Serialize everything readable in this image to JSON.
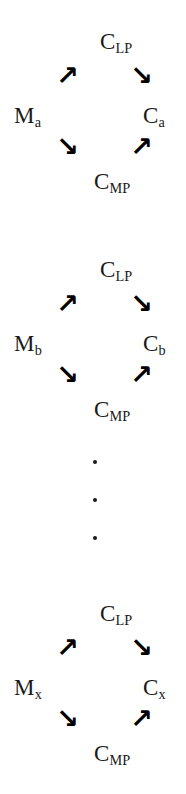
{
  "figure": {
    "type": "diagram",
    "kind": "reaction-cycle-series",
    "background_color": "#ffffff",
    "ink_color": "#1a1a1a",
    "width": 186,
    "height": 794
  },
  "blocks": [
    {
      "id": "block-a",
      "index": 1,
      "left_label": {
        "base": "M",
        "sub": "a"
      },
      "right_label": {
        "base": "C",
        "sub": "a"
      },
      "top_label": {
        "base": "C",
        "sub": "LP"
      },
      "bottom_label": {
        "base": "C",
        "sub": "MP"
      },
      "arrows": {
        "upper_left": "↗",
        "upper_right": "↘",
        "lower_left": "↘",
        "lower_right": "↗"
      }
    },
    {
      "id": "block-b",
      "index": 2,
      "left_label": {
        "base": "M",
        "sub": "b"
      },
      "right_label": {
        "base": "C",
        "sub": "b"
      },
      "top_label": {
        "base": "C",
        "sub": "LP"
      },
      "bottom_label": {
        "base": "C",
        "sub": "MP"
      },
      "arrows": {
        "upper_left": "↗",
        "upper_right": "↘",
        "lower_left": "↘",
        "lower_right": "↗"
      }
    },
    {
      "id": "block-x",
      "index": 3,
      "left_label": {
        "base": "M",
        "sub": "x"
      },
      "right_label": {
        "base": "C",
        "sub": "x"
      },
      "top_label": {
        "base": "C",
        "sub": "LP"
      },
      "bottom_label": {
        "base": "C",
        "sub": "MP"
      },
      "arrows": {
        "upper_left": "↗",
        "upper_right": "↘",
        "lower_left": "↘",
        "lower_right": "↗"
      }
    }
  ],
  "ellipsis": {
    "symbol": "·",
    "count": 3,
    "orientation": "vertical"
  }
}
